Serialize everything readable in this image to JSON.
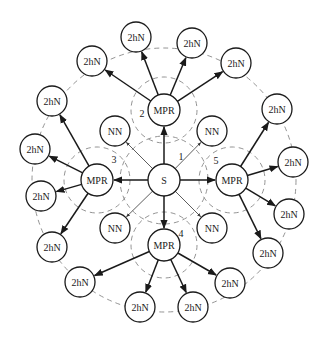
{
  "diagram": {
    "type": "MPR two-hop neighbor coverage",
    "colors": {
      "stroke": "#1a1a1a",
      "dashed": "#888888",
      "background": "#ffffff"
    },
    "outer_range": {
      "cx": 164,
      "cy": 180,
      "r": 132
    },
    "source": {
      "id": "S",
      "label": "S",
      "x": 164,
      "y": 180,
      "r": 16,
      "range_r": 44,
      "region_label": "1",
      "region_label_pos": [
        181,
        156
      ]
    },
    "mprs": [
      {
        "id": "mpr2",
        "label": "MPR",
        "x": 164,
        "y": 110,
        "region_label": "2",
        "region_label_pos": [
          142,
          113
        ]
      },
      {
        "id": "mpr3",
        "label": "MPR",
        "x": 97,
        "y": 180,
        "region_label": "3",
        "region_label_pos": [
          114,
          159
        ]
      },
      {
        "id": "mpr5",
        "label": "MPR",
        "x": 232,
        "y": 180,
        "region_label": "5",
        "region_label_pos": [
          216,
          160
        ]
      },
      {
        "id": "mpr4",
        "label": "MPR",
        "x": 164,
        "y": 245,
        "region_label": "4",
        "region_label_pos": [
          181,
          233
        ]
      }
    ],
    "mpr_radius": 16,
    "mpr_range_r": 33,
    "one_hop_neighbors": [
      {
        "id": "nn1",
        "label": "NN",
        "x": 115,
        "y": 131
      },
      {
        "id": "nn2",
        "label": "NN",
        "x": 212,
        "y": 131
      },
      {
        "id": "nn3",
        "label": "NN",
        "x": 115,
        "y": 228
      },
      {
        "id": "nn4",
        "label": "NN",
        "x": 212,
        "y": 228
      }
    ],
    "two_hop_neighbors": [
      {
        "id": "t1",
        "label": "2hN",
        "x": 136,
        "y": 37,
        "from": "mpr2"
      },
      {
        "id": "t2",
        "label": "2hN",
        "x": 192,
        "y": 43,
        "from": "mpr2"
      },
      {
        "id": "t3",
        "label": "2hN",
        "x": 236,
        "y": 63,
        "from": "mpr2"
      },
      {
        "id": "t4",
        "label": "2hN",
        "x": 92,
        "y": 61,
        "from": "mpr2"
      },
      {
        "id": "t5",
        "label": "2hN",
        "x": 52,
        "y": 101,
        "from": "mpr3"
      },
      {
        "id": "t6",
        "label": "2hN",
        "x": 35,
        "y": 149,
        "from": "mpr3"
      },
      {
        "id": "t7",
        "label": "2hN",
        "x": 41,
        "y": 196,
        "from": "mpr3"
      },
      {
        "id": "t8",
        "label": "2hN",
        "x": 52,
        "y": 247,
        "from": "mpr3"
      },
      {
        "id": "t9",
        "label": "2hN",
        "x": 277,
        "y": 109,
        "from": "mpr5"
      },
      {
        "id": "t10",
        "label": "2hN",
        "x": 293,
        "y": 162,
        "from": "mpr5"
      },
      {
        "id": "t11",
        "label": "2hN",
        "x": 289,
        "y": 214,
        "from": "mpr5"
      },
      {
        "id": "t12",
        "label": "2hN",
        "x": 268,
        "y": 253,
        "from": "mpr5"
      },
      {
        "id": "t13",
        "label": "2hN",
        "x": 80,
        "y": 282,
        "from": "mpr4"
      },
      {
        "id": "t14",
        "label": "2hN",
        "x": 140,
        "y": 307,
        "from": "mpr4"
      },
      {
        "id": "t15",
        "label": "2hN",
        "x": 193,
        "y": 307,
        "from": "mpr4"
      },
      {
        "id": "t16",
        "label": "2hN",
        "x": 230,
        "y": 283,
        "from": "mpr4"
      }
    ],
    "node_radius": 15
  }
}
